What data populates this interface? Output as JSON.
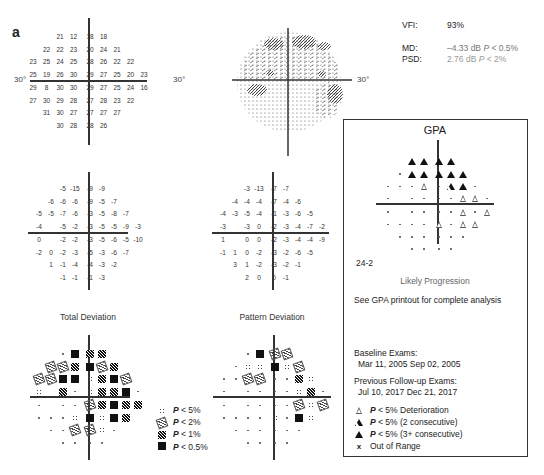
{
  "panel_label": "a",
  "threshold_plot": {
    "degree_left": "30°",
    "degree_right": "30°",
    "rows": [
      {
        "left": [
          "21",
          "12"
        ],
        "right": [
          "18",
          "18"
        ]
      },
      {
        "left": [
          "22",
          "22",
          "23"
        ],
        "right": [
          "20",
          "24",
          "21"
        ]
      },
      {
        "left": [
          "23",
          "25",
          "24",
          "25"
        ],
        "right": [
          "28",
          "26",
          "22",
          "22"
        ]
      },
      {
        "left": [
          "25",
          "19",
          "26",
          "30"
        ],
        "right": [
          "29",
          "27",
          "25",
          "20",
          "23"
        ]
      },
      {
        "left": [
          "29",
          "8",
          "30",
          "30"
        ],
        "right": [
          "29",
          "27",
          "25",
          "24",
          "16"
        ]
      },
      {
        "left": [
          "27",
          "30",
          "29",
          "28"
        ],
        "right": [
          "27",
          "28",
          "23",
          "22"
        ]
      },
      {
        "left": [
          "31",
          "30",
          "27"
        ],
        "right": [
          "27",
          "27",
          "27"
        ]
      },
      {
        "left": [
          "30",
          "28"
        ],
        "right": [
          "28",
          "26"
        ]
      }
    ]
  },
  "greyscale_plot": {
    "degree_right": "30°"
  },
  "stats": {
    "vfi_label": "VFI:",
    "vfi_value": "93%",
    "md_label": "MD:",
    "md_value": "–4.33 dB",
    "md_p": "P",
    "md_p_rest": " < 0.5%",
    "psd_label": "PSD:",
    "psd_value": "2.76 dB",
    "psd_p": "P",
    "psd_p_rest": " < 2%"
  },
  "total_deviation": {
    "title": "Total Deviation",
    "rows": [
      {
        "left": [
          "-5",
          "-15"
        ],
        "right": [
          "-9",
          "-9"
        ]
      },
      {
        "left": [
          "-6",
          "-6",
          "-6"
        ],
        "right": [
          "-9",
          "-5",
          "-7"
        ]
      },
      {
        "left": [
          "-5",
          "-5",
          "-7",
          "-6"
        ],
        "right": [
          "-3",
          "-5",
          "-8",
          "-7"
        ]
      },
      {
        "left": [
          "-4",
          "",
          "-5",
          "-2"
        ],
        "right": [
          "-3",
          "-5",
          "-5",
          "-9",
          "-3"
        ]
      },
      {
        "left": [
          "0",
          "",
          "-2",
          "-2"
        ],
        "right": [
          "-3",
          "-5",
          "-6",
          "-5",
          "-10"
        ]
      },
      {
        "left": [
          "-2",
          "0",
          "-2",
          "-3"
        ],
        "right": [
          "-5",
          "-3",
          "-6",
          "-7"
        ]
      },
      {
        "left": [
          "1",
          "-1",
          "-4"
        ],
        "right": [
          "-4",
          "-3",
          "-2"
        ]
      },
      {
        "left": [
          "-1",
          "-1"
        ],
        "right": [
          "-1",
          "-3"
        ]
      }
    ],
    "prob_rows": [
      {
        "left": [
          "dot",
          "sq"
        ],
        "right": [
          "p1",
          "p1"
        ]
      },
      {
        "left": [
          "p2",
          "p2",
          "p1"
        ],
        "right": [
          "sq",
          "p2",
          "p1"
        ]
      },
      {
        "left": [
          "p2",
          "p2",
          "sq",
          "sq"
        ],
        "right": [
          "p5",
          "p1",
          "sq",
          "p2"
        ]
      },
      {
        "left": [
          "p5",
          "",
          "p1",
          "dot"
        ],
        "right": [
          "p5",
          "p1",
          "p1",
          "sq",
          "dot"
        ]
      },
      {
        "left": [
          "dot",
          "",
          "dot",
          "dot"
        ],
        "right": [
          "p2",
          "p1",
          "sq",
          "p1",
          "p1"
        ]
      },
      {
        "left": [
          "dot",
          "dot",
          "dot",
          "p5"
        ],
        "right": [
          "sq",
          "p5",
          "sq",
          "p1"
        ]
      },
      {
        "left": [
          "dot",
          "dot",
          "p2"
        ],
        "right": [
          "p2",
          "p5",
          "dot"
        ]
      },
      {
        "left": [
          "dot",
          "dot"
        ],
        "right": [
          "dot",
          "dot"
        ]
      }
    ]
  },
  "pattern_deviation": {
    "title": "Pattern Deviation",
    "rows": [
      {
        "left": [
          "-3",
          "-13"
        ],
        "right": [
          "-7",
          "-7"
        ]
      },
      {
        "left": [
          "-4",
          "-4",
          "-4"
        ],
        "right": [
          "-7",
          "-4",
          "-6"
        ]
      },
      {
        "left": [
          "-4",
          "-3",
          "-5",
          "-4"
        ],
        "right": [
          "-1",
          "-3",
          "-6",
          "-5"
        ]
      },
      {
        "left": [
          "-3",
          "",
          "-3",
          "0"
        ],
        "right": [
          "-2",
          "-3",
          "-4",
          "-7",
          "-2"
        ]
      },
      {
        "left": [
          "1",
          "",
          "0",
          "0"
        ],
        "right": [
          "-2",
          "-3",
          "-4",
          "-4",
          "-9"
        ]
      },
      {
        "left": [
          "-1",
          "1",
          "0",
          "-2"
        ],
        "right": [
          "-3",
          "-2",
          "-6",
          "-5"
        ]
      },
      {
        "left": [
          "3",
          "1",
          "-2"
        ],
        "right": [
          "-3",
          "-2",
          "-1"
        ]
      },
      {
        "left": [
          "2",
          "0"
        ],
        "right": [
          "0",
          "-1"
        ]
      }
    ],
    "prob_rows": [
      {
        "left": [
          "dot",
          "sq"
        ],
        "right": [
          "p2",
          "p2"
        ]
      },
      {
        "left": [
          "dot",
          "p5",
          "p5"
        ],
        "right": [
          "sq",
          "p5",
          "p2"
        ]
      },
      {
        "left": [
          "dot",
          "dot",
          "p2",
          "p2"
        ],
        "right": [
          "dot",
          "dot",
          "p1",
          "p5"
        ]
      },
      {
        "left": [
          "dot",
          "",
          "dot",
          "dot"
        ],
        "right": [
          "dot",
          "dot",
          "p5",
          "p1",
          "dot"
        ]
      },
      {
        "left": [
          "dot",
          "",
          "dot",
          "dot"
        ],
        "right": [
          "dot",
          "dot",
          "p2",
          "p5",
          "p2"
        ]
      },
      {
        "left": [
          "dot",
          "dot",
          "dot",
          "dot"
        ],
        "right": [
          "p5",
          "dot",
          "sq",
          "p5"
        ]
      },
      {
        "left": [
          "dot",
          "dot",
          "dot"
        ],
        "right": [
          "dot",
          "dot",
          "dot"
        ]
      },
      {
        "left": [
          "dot",
          "dot"
        ],
        "right": [
          "dot",
          "dot"
        ]
      }
    ]
  },
  "prob_legend": [
    {
      "symbol": "p5",
      "p": "P",
      "text": " < 5%"
    },
    {
      "symbol": "p2",
      "p": "P",
      "text": " < 2%"
    },
    {
      "symbol": "p1",
      "p": "P",
      "text": " < 1%"
    },
    {
      "symbol": "sq",
      "p": "P",
      "text": " < 0.5%"
    }
  ],
  "gpa": {
    "title": "GPA",
    "test_pattern": "24-2",
    "status": "Likely Progression",
    "note": "See GPA printout for complete analysis",
    "rows": [
      {
        "left": [
          "tf",
          "tf"
        ],
        "right": [
          "tf",
          "tf"
        ]
      },
      {
        "left": [
          "dot",
          "tf",
          "tf"
        ],
        "right": [
          "tf",
          "tf",
          "tf"
        ]
      },
      {
        "left": [
          "dot",
          "dot",
          "dot",
          "to"
        ],
        "right": [
          "dot",
          "th",
          "tf",
          "dot"
        ]
      },
      {
        "left": [
          "dot",
          "",
          "dot",
          "dot"
        ],
        "right": [
          "dot",
          "dot",
          "to",
          "to",
          "dot"
        ]
      },
      {
        "left": [
          "dot",
          "",
          "dot",
          "dot"
        ],
        "right": [
          "dot",
          "dot",
          "to",
          "dot",
          "to"
        ]
      },
      {
        "left": [
          "dot",
          "dot",
          "dot",
          "dot"
        ],
        "right": [
          "to",
          "dot",
          "to",
          "to"
        ]
      },
      {
        "left": [
          "dot",
          "dot",
          "dot"
        ],
        "right": [
          "dot",
          "dot",
          "dot"
        ]
      },
      {
        "left": [
          "dot",
          "dot"
        ],
        "right": [
          "dot",
          "dot"
        ]
      }
    ],
    "baseline_label": "Baseline Exams:",
    "baseline_dates": "Mar 11, 2005 Sep 02, 2005",
    "followup_label": "Previous Follow-up Exams:",
    "followup_dates": "Jul 10, 2017 Dec 21, 2017",
    "legend": [
      {
        "symbol": "to",
        "p": "P",
        "text": " < 5% Deterioration"
      },
      {
        "symbol": "th",
        "p": "P",
        "text": " < 5% (2 consecutive)"
      },
      {
        "symbol": "tf",
        "p": "P",
        "text": " < 5% (3+ consecutive)"
      },
      {
        "symbol": "x",
        "p": "",
        "text": "Out of Range"
      }
    ]
  }
}
